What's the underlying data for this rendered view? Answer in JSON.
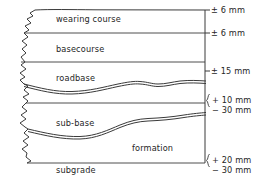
{
  "figure": {
    "type": "cross-section-diagram",
    "background_color": "#ffffff",
    "line_color": "#3a3a3a",
    "text_color": "#262626"
  },
  "layers": [
    {
      "id": "wearing-course",
      "label": "wearing course"
    },
    {
      "id": "basecourse",
      "label": "basecourse"
    },
    {
      "id": "roadbase",
      "label": "roadbase"
    },
    {
      "id": "sub-base",
      "label": "sub-base"
    },
    {
      "id": "formation",
      "label": "formation"
    },
    {
      "id": "subgrade",
      "label": "subgrade"
    }
  ],
  "tolerances": [
    {
      "id": "tol-wearing-course-surface",
      "text": "± 6 mm",
      "bracketed": false
    },
    {
      "id": "tol-basecourse-surface",
      "text": "± 6 mm",
      "bracketed": false
    },
    {
      "id": "tol-roadbase-surface",
      "text": "± 15 mm",
      "bracketed": false
    },
    {
      "id": "tol-sub-base-upper",
      "text": "+ 10 mm",
      "bracketed": true
    },
    {
      "id": "tol-sub-base-lower",
      "text": "− 30 mm",
      "bracketed": true
    },
    {
      "id": "tol-formation-upper",
      "text": "+ 20 mm",
      "bracketed": true
    },
    {
      "id": "tol-formation-lower",
      "text": "− 30 mm",
      "bracketed": true
    }
  ]
}
